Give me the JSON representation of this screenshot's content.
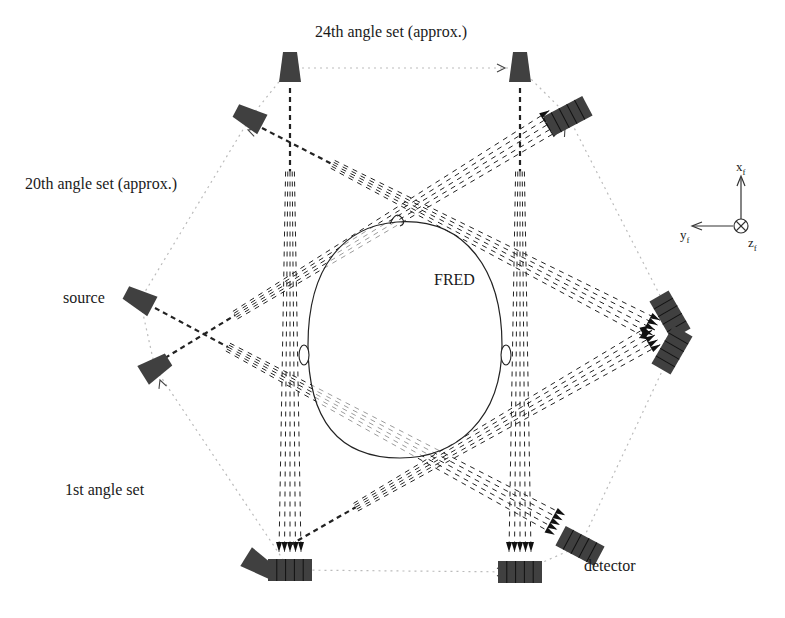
{
  "labels": {
    "angle_24": "24th angle set (approx.)",
    "angle_20": "20th angle set (approx.)",
    "angle_1": "1st angle set",
    "source": "source",
    "detector": "detector",
    "phantom": "FRED"
  },
  "axes": {
    "x": "x",
    "x_sub": "f",
    "y": "y",
    "y_sub": "f",
    "z": "z",
    "z_sub": "f"
  },
  "colors": {
    "component_fill": "#404040",
    "ray": "#222222",
    "orbit": "#bbbbbb",
    "outline": "#222222"
  },
  "sources": [
    {
      "id": "src-24-left",
      "cx": 290,
      "cy": 68,
      "angle": 0
    },
    {
      "id": "src-24-right",
      "cx": 520,
      "cy": 68,
      "angle": 0
    },
    {
      "id": "src-20-a",
      "cx": 250,
      "cy": 118,
      "angle": -62
    },
    {
      "id": "src-1-left",
      "cx": 140,
      "cy": 300,
      "angle": -62
    },
    {
      "id": "src-1-b",
      "cx": 155,
      "cy": 368,
      "angle": 58
    },
    {
      "id": "src-bottom",
      "cx": 258,
      "cy": 564,
      "angle": 122
    }
  ],
  "detectors": [
    {
      "id": "det-top-right",
      "cx": 568,
      "cy": 116,
      "angle": -28
    },
    {
      "id": "det-right-a",
      "cx": 670,
      "cy": 315,
      "angle": 60
    },
    {
      "id": "det-right-b",
      "cx": 672,
      "cy": 350,
      "angle": -60
    },
    {
      "id": "det-bottom-l",
      "cx": 290,
      "cy": 570,
      "angle": 0
    },
    {
      "id": "det-bottom-r",
      "cx": 520,
      "cy": 572,
      "angle": 0
    },
    {
      "id": "det-bottom-rr",
      "cx": 580,
      "cy": 546,
      "angle": 28
    }
  ],
  "beams": [
    {
      "from": [
        290,
        88
      ],
      "to": [
        290,
        552
      ],
      "kind": "vertical"
    },
    {
      "from": [
        520,
        88
      ],
      "to": [
        520,
        552
      ],
      "kind": "vertical"
    },
    {
      "from": [
        262,
        128
      ],
      "to": [
        655,
        330
      ],
      "kind": "diag"
    },
    {
      "from": [
        155,
        308
      ],
      "to": [
        560,
        525
      ],
      "kind": "diag"
    },
    {
      "from": [
        165,
        358
      ],
      "to": [
        555,
        120
      ],
      "kind": "diag"
    },
    {
      "from": [
        290,
        545
      ],
      "to": [
        655,
        335
      ],
      "kind": "diag"
    }
  ],
  "orbit": [
    [
      290,
      68
    ],
    [
      520,
      68
    ],
    [
      568,
      116
    ],
    [
      670,
      315
    ],
    [
      672,
      350
    ],
    [
      580,
      546
    ],
    [
      520,
      572
    ],
    [
      290,
      570
    ],
    [
      155,
      368
    ],
    [
      140,
      300
    ],
    [
      250,
      118
    ]
  ],
  "head": {
    "cx": 405,
    "cy": 340,
    "rx": 97,
    "ry": 118
  }
}
